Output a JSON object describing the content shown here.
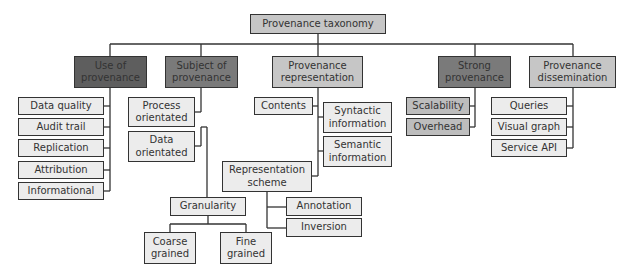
{
  "diagram": {
    "type": "tree",
    "root": {
      "label": "Provenance taxonomy"
    },
    "categories": [
      {
        "label": "Use of\nprovenance",
        "children": [
          "Data quality",
          "Audit trail",
          "Replication",
          "Attribution",
          "Informational"
        ]
      },
      {
        "label": "Subject of\nprovenance",
        "children": [
          "Process\norientated",
          "Data\norientated"
        ],
        "granularity": {
          "label": "Granularity",
          "children": [
            "Coarse\ngrained",
            "Fine\ngrained"
          ]
        }
      },
      {
        "label": "Provenance\nrepresentation",
        "children": [
          "Contents",
          "Syntactic\ninformation",
          "Semantic\ninformation"
        ],
        "scheme": {
          "label": "Representation\nscheme",
          "children": [
            "Annotation",
            "Inversion"
          ]
        }
      },
      {
        "label": "Strong\nprovenance",
        "children": [
          "Scalability",
          "Overhead"
        ]
      },
      {
        "label": "Provenance\ndissemination",
        "children": [
          "Queries",
          "Visual graph",
          "Service API"
        ]
      }
    ]
  },
  "colors": {
    "border": "#333333",
    "light_fill": "#ececec",
    "mid_fill": "#c6c6c6",
    "dark_fill": "#7a7a7a",
    "darkest_fill": "#5e5e5e"
  }
}
